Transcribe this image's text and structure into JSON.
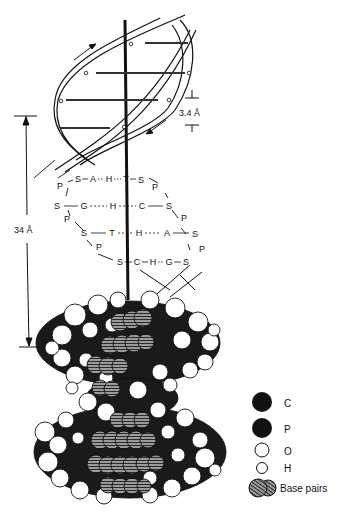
{
  "figure": {
    "dimensions": {
      "rise_per_base_pair": "3.4 Å",
      "helical_pitch": "34 Å"
    },
    "base_pair_rows": [
      {
        "left": [
          "P",
          "S",
          "A",
          "H",
          "T",
          "S",
          "P"
        ],
        "text": "P-S-A--H--T-S-P"
      },
      {
        "left": [
          "S",
          "G",
          "H",
          "C",
          "S"
        ],
        "text": "S — G - - - H - - C — S"
      },
      {
        "left": [
          "P",
          "S",
          "T",
          "H",
          "A",
          "S",
          "P"
        ],
        "text": "P S — T - - H - - - A — S P"
      },
      {
        "left": [
          "P",
          "S",
          "C",
          "H",
          "G",
          "S"
        ],
        "text": "P S-C-H--G-S"
      }
    ],
    "rows": {
      "r1": {
        "p1": "P",
        "s1": "S",
        "b1": "A",
        "h": "H",
        "b2": "T",
        "s2": "S",
        "p2": "P"
      },
      "r2": {
        "s1": "S",
        "b1": "G",
        "h": "H",
        "b2": "C",
        "s2": "S",
        "p2": "P"
      },
      "r3": {
        "p1": "P",
        "s1": "S",
        "b1": "T",
        "h": "H",
        "b2": "A",
        "s2": "S",
        "p2": "P"
      },
      "r4": {
        "p1": "P",
        "s1": "S",
        "b1": "C",
        "h": "H",
        "b2": "G",
        "s2": "S"
      }
    },
    "legend": {
      "items": [
        {
          "label": "C",
          "symbol": "large-black-circle"
        },
        {
          "label": "P",
          "symbol": "large-black-circle"
        },
        {
          "label": "O",
          "symbol": "white-circle"
        },
        {
          "label": "H",
          "symbol": "small-white-circle"
        },
        {
          "label": "Base pairs",
          "symbol": "hatched-circles"
        }
      ]
    }
  },
  "labels": {
    "rise": "3.4 Å",
    "pitch": "34 Å"
  },
  "legend": {
    "c": "C",
    "p": "P",
    "o": "O",
    "h": "H",
    "bp": "Base pairs"
  },
  "colors": {
    "ink": "#111111",
    "background": "#ffffff",
    "hatch": "#555555"
  }
}
